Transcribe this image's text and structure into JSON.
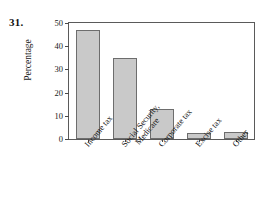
{
  "problem": {
    "number": "31."
  },
  "chart_data": {
    "type": "bar",
    "title": "",
    "xlabel": "",
    "ylabel": "Percentage",
    "ylim": [
      0,
      50
    ],
    "yticks": [
      0,
      10,
      20,
      30,
      40,
      50
    ],
    "ytick_labels": [
      "0",
      "10",
      "20",
      "30",
      "40",
      "50"
    ],
    "grid": false,
    "legend": "none",
    "categories": [
      "Income tax",
      "Social Security, Medicare",
      "Corporate tax",
      "Excise tax",
      "Other"
    ],
    "category_lines": [
      [
        "Income tax"
      ],
      [
        "Social Security,",
        "Medicare"
      ],
      [
        "Corporate tax"
      ],
      [
        "Excise tax"
      ],
      [
        "Other"
      ]
    ],
    "values": [
      47,
      35,
      13,
      2.5,
      3
    ],
    "bar_fill": "#c9c9c9",
    "bar_edge": "#6d6d6d",
    "axis_color": "#5a5a5a"
  }
}
